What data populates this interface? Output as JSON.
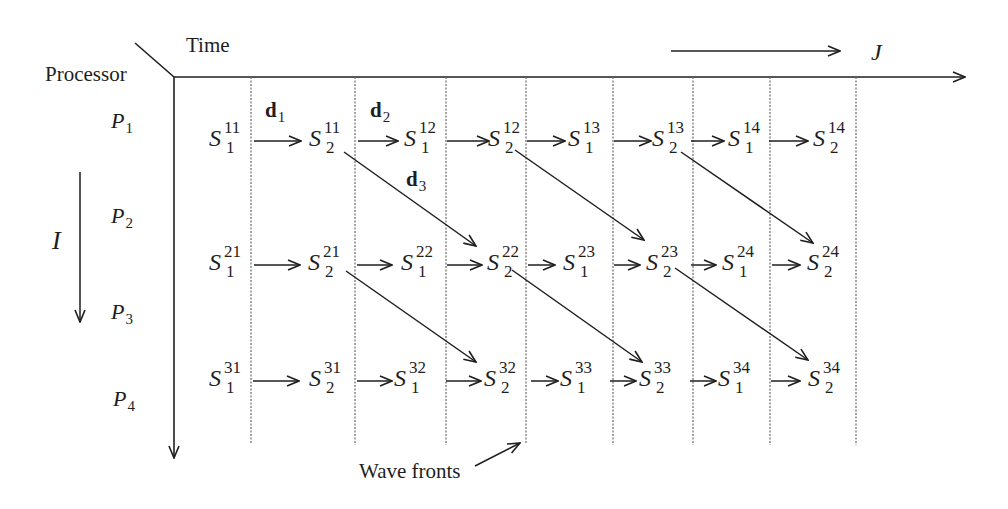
{
  "axes": {
    "corner_label_time": "Time",
    "corner_label_processor": "Processor",
    "horizontal_axis_label": "J",
    "vertical_axis_label": "I"
  },
  "processors": [
    {
      "letter": "P",
      "index": "1"
    },
    {
      "letter": "P",
      "index": "2"
    },
    {
      "letter": "P",
      "index": "3"
    },
    {
      "letter": "P",
      "index": "4"
    }
  ],
  "dependences": [
    {
      "letter": "d",
      "index": "1"
    },
    {
      "letter": "d",
      "index": "2"
    },
    {
      "letter": "d",
      "index": "3"
    }
  ],
  "statement_rows": [
    {
      "row": "P1 row",
      "cells": [
        {
          "base": "S",
          "sup": "11",
          "sub": "1"
        },
        {
          "base": "S",
          "sup": "11",
          "sub": "2"
        },
        {
          "base": "S",
          "sup": "12",
          "sub": "1"
        },
        {
          "base": "S",
          "sup": "12",
          "sub": "2"
        },
        {
          "base": "S",
          "sup": "13",
          "sub": "1"
        },
        {
          "base": "S",
          "sup": "13",
          "sub": "2"
        },
        {
          "base": "S",
          "sup": "14",
          "sub": "1"
        },
        {
          "base": "S",
          "sup": "14",
          "sub": "2"
        }
      ]
    },
    {
      "row": "P2-P3 row",
      "cells": [
        {
          "base": "S",
          "sup": "21",
          "sub": "1"
        },
        {
          "base": "S",
          "sup": "21",
          "sub": "2"
        },
        {
          "base": "S",
          "sup": "22",
          "sub": "1"
        },
        {
          "base": "S",
          "sup": "22",
          "sub": "2"
        },
        {
          "base": "S",
          "sup": "23",
          "sub": "1"
        },
        {
          "base": "S",
          "sup": "23",
          "sub": "2"
        },
        {
          "base": "S",
          "sup": "24",
          "sub": "1"
        },
        {
          "base": "S",
          "sup": "24",
          "sub": "2"
        }
      ]
    },
    {
      "row": "P4 row",
      "cells": [
        {
          "base": "S",
          "sup": "31",
          "sub": "1"
        },
        {
          "base": "S",
          "sup": "31",
          "sub": "2"
        },
        {
          "base": "S",
          "sup": "32",
          "sub": "1"
        },
        {
          "base": "S",
          "sup": "32",
          "sub": "2"
        },
        {
          "base": "S",
          "sup": "33",
          "sub": "1"
        },
        {
          "base": "S",
          "sup": "33",
          "sub": "2"
        },
        {
          "base": "S",
          "sup": "34",
          "sub": "1"
        },
        {
          "base": "S",
          "sup": "34",
          "sub": "2"
        }
      ]
    }
  ],
  "annotation": {
    "wave_fronts_label": "Wave fronts"
  },
  "colors": {
    "ink": "#1e1e1e",
    "wavefront_line": "#6a6a6a",
    "background": "#ffffff"
  }
}
